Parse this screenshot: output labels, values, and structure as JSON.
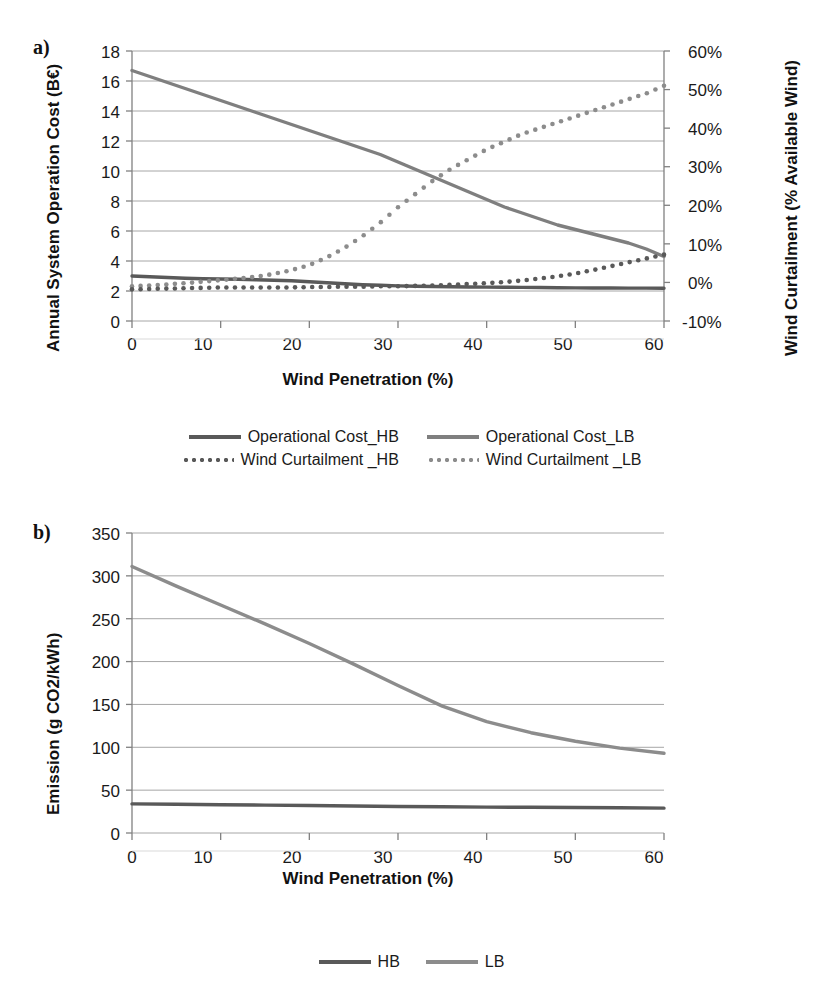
{
  "figure": {
    "panels": [
      {
        "tag": "a)",
        "ylabel_left": "Annual System Operation Cost (B€)",
        "ylabel_right": "Wind Curtailment (% Available Wind)",
        "xlabel": "Wind Penetration (%)"
      },
      {
        "tag": "b)",
        "ylabel_left": "Emission (g CO2/kWh)",
        "xlabel": "Wind Penetration (%)"
      }
    ]
  },
  "colors": {
    "hb_line": "#595959",
    "lb_line": "#7f7f7f",
    "hb_dots": "#595959",
    "lb_dots": "#8c8c8c",
    "grid": "#a6a6a6",
    "axis": "#808080",
    "text": "#1a1a1a"
  },
  "legend_a": {
    "rows": [
      [
        {
          "label": "Operational Cost_HB",
          "style": "solid",
          "color": "#595959"
        },
        {
          "label": "Operational Cost_LB",
          "style": "solid",
          "color": "#7f7f7f"
        }
      ],
      [
        {
          "label": "Wind Curtailment _HB",
          "style": "dotted",
          "color": "#595959"
        },
        {
          "label": "Wind Curtailment _LB",
          "style": "dotted",
          "color": "#8c8c8c"
        }
      ]
    ]
  },
  "legend_b": {
    "rows": [
      [
        {
          "label": "HB",
          "style": "solid",
          "color": "#595959"
        },
        {
          "label": "LB",
          "style": "solid",
          "color": "#8c8c8c"
        }
      ]
    ]
  },
  "chart_data": [
    {
      "id": "panel-a",
      "type": "line",
      "title": "a)",
      "xlabel": "Wind Penetration (%)",
      "ylabel": "Annual System Operation Cost (B€)",
      "y2label": "Wind Curtailment (% Available Wind)",
      "xlim": [
        0,
        60
      ],
      "ylim": [
        0,
        18
      ],
      "y2lim": [
        -10,
        60
      ],
      "xticks": [
        0,
        10,
        20,
        30,
        40,
        50,
        60
      ],
      "yticks": [
        0,
        2,
        4,
        6,
        8,
        10,
        12,
        14,
        16,
        18
      ],
      "y2ticks": [
        "-10%",
        "0%",
        "10%",
        "20%",
        "30%",
        "40%",
        "50%",
        "60%"
      ],
      "grid": true,
      "legend_position": "below",
      "x": [
        0,
        2,
        4,
        6,
        8,
        10,
        12,
        14,
        16,
        18,
        20,
        22,
        24,
        26,
        28,
        30,
        32,
        34,
        36,
        38,
        40,
        42,
        44,
        46,
        48,
        50,
        52,
        54,
        56,
        58,
        60
      ],
      "series": [
        {
          "name": "Operational Cost_LB",
          "axis": "left",
          "style": "solid",
          "color": "#7f7f7f",
          "unit": "B€",
          "values": [
            16.7,
            16.3,
            15.9,
            15.5,
            15.1,
            14.7,
            14.3,
            13.9,
            13.5,
            13.1,
            12.7,
            12.3,
            11.9,
            11.5,
            11.1,
            10.6,
            10.1,
            9.6,
            9.1,
            8.6,
            8.1,
            7.6,
            7.2,
            6.8,
            6.4,
            6.1,
            5.8,
            5.5,
            5.2,
            4.8,
            4.3
          ]
        },
        {
          "name": "Operational Cost_HB",
          "axis": "left",
          "style": "solid",
          "color": "#595959",
          "unit": "B€",
          "values": [
            3.0,
            2.95,
            2.9,
            2.85,
            2.82,
            2.8,
            2.78,
            2.75,
            2.72,
            2.68,
            2.62,
            2.55,
            2.48,
            2.42,
            2.38,
            2.34,
            2.32,
            2.3,
            2.28,
            2.27,
            2.26,
            2.25,
            2.24,
            2.23,
            2.22,
            2.21,
            2.2,
            2.2,
            2.19,
            2.19,
            2.18
          ]
        },
        {
          "name": "Wind Curtailment _LB",
          "axis": "right",
          "style": "dotted",
          "color": "#8c8c8c",
          "unit": "%",
          "values": [
            -1.0,
            -0.8,
            -0.5,
            -0.2,
            0.2,
            0.6,
            1.0,
            1.5,
            2.2,
            3.2,
            4.5,
            6.5,
            9.0,
            12.0,
            15.5,
            19.5,
            23.0,
            26.5,
            29.5,
            32.0,
            34.5,
            36.5,
            38.5,
            40.0,
            41.5,
            43.0,
            44.5,
            46.0,
            47.5,
            49.0,
            51.0
          ]
        },
        {
          "name": "Wind Curtailment _HB",
          "axis": "right",
          "style": "dotted",
          "color": "#595959",
          "unit": "%",
          "values": [
            -1.8,
            -1.7,
            -1.6,
            -1.5,
            -1.4,
            -1.3,
            -1.3,
            -1.3,
            -1.3,
            -1.3,
            -1.2,
            -1.2,
            -1.1,
            -1.1,
            -1.0,
            -1.0,
            -0.9,
            -0.8,
            -0.6,
            -0.4,
            -0.2,
            0.1,
            0.5,
            1.0,
            1.6,
            2.3,
            3.2,
            4.2,
            5.2,
            6.2,
            7.2
          ]
        }
      ]
    },
    {
      "id": "panel-b",
      "type": "line",
      "title": "b)",
      "xlabel": "Wind Penetration (%)",
      "ylabel": "Emission (g CO2/kWh)",
      "xlim": [
        0,
        60
      ],
      "ylim": [
        0,
        350
      ],
      "xticks": [
        0,
        10,
        20,
        30,
        40,
        50,
        60
      ],
      "yticks": [
        0,
        50,
        100,
        150,
        200,
        250,
        300,
        350
      ],
      "grid": true,
      "legend_position": "below",
      "x": [
        0,
        5,
        10,
        15,
        20,
        25,
        30,
        35,
        40,
        45,
        50,
        55,
        60
      ],
      "series": [
        {
          "name": "LB",
          "style": "solid",
          "color": "#8c8c8c",
          "unit": "g CO2/kWh",
          "values": [
            311,
            288,
            266,
            244,
            221,
            197,
            172,
            148,
            130,
            117,
            107,
            99,
            93
          ]
        },
        {
          "name": "HB",
          "style": "solid",
          "color": "#595959",
          "unit": "g CO2/kWh",
          "values": [
            34,
            33.5,
            33,
            32.5,
            32,
            31.5,
            31,
            30.6,
            30.2,
            30,
            29.7,
            29.4,
            29
          ]
        }
      ]
    }
  ]
}
